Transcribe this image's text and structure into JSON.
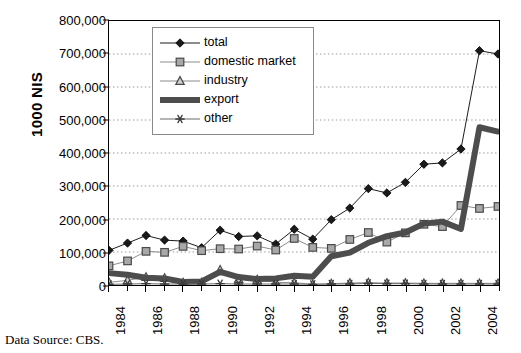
{
  "chart_data": {
    "type": "line",
    "title": "",
    "xlabel": "",
    "ylabel": "1000 NIS",
    "ylim": [
      0,
      800000
    ],
    "ytick_step": 100000,
    "ytick_labels": [
      "0",
      "100,000",
      "200,000",
      "300,000",
      "400,000",
      "500,000",
      "600,000",
      "700,000",
      "800,000"
    ],
    "ytick_values": [
      0,
      100000,
      200000,
      300000,
      400000,
      500000,
      600000,
      700000,
      800000
    ],
    "grid": "horizontal-dotted",
    "legend_position": "top-left-inside",
    "x": [
      1984,
      1985,
      1986,
      1987,
      1988,
      1989,
      1990,
      1991,
      1992,
      1993,
      1994,
      1995,
      1996,
      1997,
      1998,
      1999,
      2000,
      2001,
      2002,
      2003,
      2004,
      2005
    ],
    "xtick_labels": [
      "1984",
      "",
      "1986",
      "",
      "1988",
      "",
      "1990",
      "",
      "1992",
      "",
      "1994",
      "",
      "1996",
      "",
      "1998",
      "",
      "2000",
      "",
      "2002",
      "",
      "2004",
      ""
    ],
    "xtick_labeled_values": [
      1984,
      1986,
      1988,
      1990,
      1992,
      1994,
      1996,
      1998,
      2000,
      2002,
      2004
    ],
    "series": [
      {
        "name": "total",
        "marker": "diamond",
        "color": "#1a1a1a",
        "line_width": 1,
        "values": [
          105000,
          127000,
          150000,
          136000,
          133000,
          113000,
          166000,
          147000,
          149000,
          124000,
          169000,
          139000,
          198000,
          233000,
          292000,
          279000,
          311000,
          366000,
          370000,
          412000,
          710000,
          700000
        ]
      },
      {
        "name": "domestic market",
        "marker": "square",
        "color": "#8c8c8c",
        "line_width": 1,
        "values": [
          58000,
          73000,
          102000,
          99000,
          117000,
          104000,
          110000,
          109000,
          118000,
          106000,
          141000,
          114000,
          111000,
          138000,
          159000,
          130000,
          158000,
          184000,
          177000,
          241000,
          232000,
          238000
        ]
      },
      {
        "name": "industry",
        "marker": "triangle",
        "color": "#8c8c8c",
        "line_width": 1,
        "values": [
          8000,
          14000,
          24000,
          21000,
          7000,
          7000,
          46000,
          18000,
          16000,
          8000,
          7000,
          2000,
          4000,
          6000,
          7000,
          6000,
          6000,
          5000,
          5000,
          5000,
          5000,
          5000
        ]
      },
      {
        "name": "export",
        "marker": "none",
        "color": "#4d4d4d",
        "line_width": 6,
        "values": [
          36000,
          31000,
          22000,
          20000,
          9000,
          11000,
          40000,
          24000,
          18000,
          20000,
          28000,
          25000,
          87000,
          98000,
          128000,
          148000,
          159000,
          186000,
          192000,
          170000,
          478000,
          465000
        ]
      },
      {
        "name": "other",
        "marker": "asterisk",
        "color": "#6b6b6b",
        "line_width": 1,
        "values": [
          2000,
          3000,
          4000,
          3000,
          3000,
          3000,
          4000,
          3000,
          3000,
          3000,
          3000,
          2000,
          3000,
          3000,
          5000,
          4000,
          4000,
          3000,
          3000,
          3000,
          3000,
          3000
        ]
      }
    ]
  },
  "legend": {
    "items": [
      {
        "label": "total",
        "marker": "diamond-icon"
      },
      {
        "label": "domestic market",
        "marker": "square-icon"
      },
      {
        "label": "industry",
        "marker": "triangle-icon"
      },
      {
        "label": "export",
        "marker": "thick-line-icon"
      },
      {
        "label": "other",
        "marker": "asterisk-icon"
      }
    ]
  },
  "footer": {
    "data_source": "Data Source: CBS."
  }
}
